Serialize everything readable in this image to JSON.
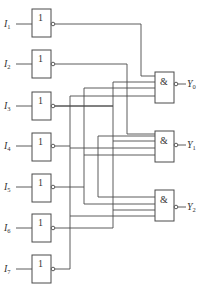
{
  "diagram": {
    "type": "logic-circuit",
    "inputs": [
      {
        "name": "I",
        "sub": "1"
      },
      {
        "name": "I",
        "sub": "2"
      },
      {
        "name": "I",
        "sub": "3"
      },
      {
        "name": "I",
        "sub": "4"
      },
      {
        "name": "I",
        "sub": "5"
      },
      {
        "name": "I",
        "sub": "6"
      },
      {
        "name": "I",
        "sub": "7"
      }
    ],
    "not_gate_symbol": "1",
    "and_gate_symbol": "&",
    "outputs": [
      {
        "name": "Y",
        "sub": "0"
      },
      {
        "name": "Y",
        "sub": "1"
      },
      {
        "name": "Y",
        "sub": "2"
      }
    ],
    "colors": {
      "line": "#4a4a4a",
      "background": "#ffffff"
    }
  }
}
